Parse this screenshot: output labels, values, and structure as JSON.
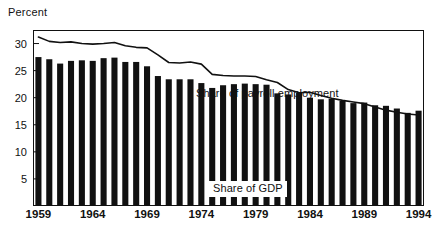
{
  "chart_data": {
    "type": "bar",
    "title": "",
    "subtitle": "",
    "xlabel": "",
    "ylabel": "Percent",
    "ylim": [
      0,
      32.5
    ],
    "xlim": [
      1959,
      1994
    ],
    "grid": false,
    "legend_position": "inline-annotation",
    "yticks": [
      5,
      10,
      15,
      20,
      25,
      30
    ],
    "ytick_labels": [
      "5",
      "10",
      "15",
      "20",
      "25",
      "30"
    ],
    "xticks": [
      1959,
      1964,
      1969,
      1974,
      1979,
      1984,
      1989,
      1994
    ],
    "xtick_labels": [
      "1959",
      "1964",
      "1969",
      "1974",
      "1979",
      "1984",
      "1989",
      "1994"
    ],
    "categories": [
      1959,
      1960,
      1961,
      1962,
      1963,
      1964,
      1965,
      1966,
      1967,
      1968,
      1969,
      1970,
      1971,
      1972,
      1973,
      1974,
      1975,
      1976,
      1977,
      1978,
      1979,
      1980,
      1981,
      1982,
      1983,
      1984,
      1985,
      1986,
      1987,
      1988,
      1989,
      1990,
      1991,
      1992,
      1993,
      1994
    ],
    "series": [
      {
        "name": "Share of GDP",
        "type": "bar",
        "color": "#111111",
        "values": [
          27.5,
          27.1,
          26.3,
          26.8,
          26.9,
          26.8,
          27.3,
          27.4,
          26.6,
          26.6,
          25.8,
          24.0,
          23.4,
          23.4,
          23.4,
          22.7,
          21.8,
          22.3,
          22.5,
          22.6,
          22.5,
          22.4,
          20.8,
          20.6,
          20.9,
          20.0,
          19.7,
          19.8,
          19.4,
          19.0,
          19.1,
          18.6,
          18.5,
          18.0,
          17.2,
          17.6
        ]
      },
      {
        "name": "Share of payroll employment",
        "type": "line",
        "color": "#111111",
        "values": [
          31.2,
          30.4,
          30.2,
          30.3,
          30.0,
          29.9,
          30.0,
          30.2,
          29.6,
          29.3,
          29.2,
          27.9,
          26.5,
          26.4,
          26.6,
          26.2,
          24.3,
          24.1,
          24.0,
          24.0,
          23.9,
          23.3,
          22.8,
          21.5,
          20.9,
          21.0,
          20.4,
          19.9,
          19.5,
          19.2,
          18.9,
          18.3,
          17.7,
          17.3,
          17.0,
          16.8
        ]
      }
    ],
    "annotations": [
      {
        "text": "Share of payroll employment",
        "target_series": "Share of payroll employment"
      },
      {
        "text": "Share of GDP",
        "target_series": "Share of GDP"
      }
    ]
  },
  "axis": {
    "y_axis_title": "Percent"
  }
}
